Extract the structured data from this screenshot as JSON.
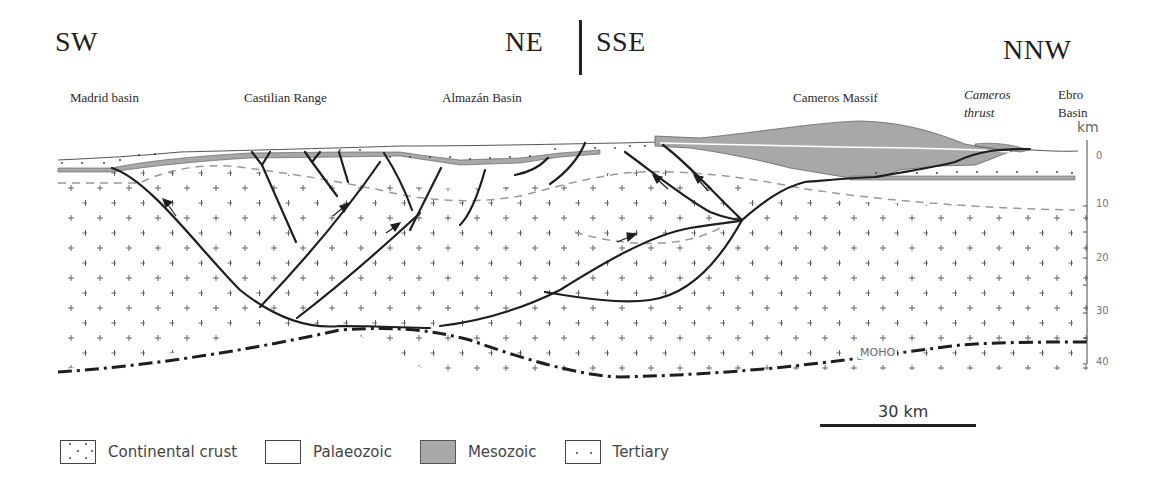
{
  "directions": {
    "left": "SW",
    "middle_left": "NE",
    "middle_right": "SSE",
    "right": "NNW"
  },
  "places": [
    {
      "label": "Madrid basin"
    },
    {
      "label": "Castilian Range"
    },
    {
      "label": "Almazán Basin"
    },
    {
      "label": "Cameros Massif"
    },
    {
      "label": "Cameros",
      "label2": "thrust",
      "italic": true
    },
    {
      "label": "Ebro",
      "label2": "Basin"
    }
  ],
  "depth_axis": {
    "unit": "km",
    "ticks": [
      "0",
      "10",
      "20",
      "30",
      "40"
    ]
  },
  "annotations": {
    "moho": "MOHO"
  },
  "scale_bar": {
    "label": "30 km"
  },
  "legend": [
    {
      "label": "Continental crust",
      "pattern": "crosses"
    },
    {
      "label": "Palaeozoic",
      "pattern": "blank"
    },
    {
      "label": "Mesozoic",
      "pattern": "grey",
      "color": "#a8a8a8"
    },
    {
      "label": "Tertiary",
      "pattern": "dots"
    }
  ],
  "colors": {
    "mesozoic": "#a8a8a8",
    "fault": "#1e1e1e",
    "dashed_boundary": "#999999",
    "crust_cross": "#555555"
  }
}
